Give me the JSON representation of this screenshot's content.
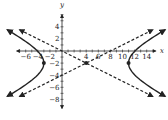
{
  "chart_data": {
    "type": "line",
    "title": "",
    "xlabel": "x",
    "ylabel": "y",
    "xlim": [
      -7.5,
      15.5
    ],
    "ylim": [
      -9.5,
      6
    ],
    "x_ticks": [
      -6,
      -4,
      -2,
      2,
      4,
      6,
      8,
      10,
      12,
      14
    ],
    "x_tick_labels": [
      "−6",
      "−4",
      "−2",
      "",
      "4",
      "6",
      "8",
      "10",
      "12",
      "14"
    ],
    "y_ticks": [
      4,
      2,
      -2,
      -4,
      -6,
      -8
    ],
    "y_tick_labels": [
      "4",
      "2",
      "−2",
      "−4",
      "−6",
      "−8"
    ],
    "grid": false,
    "legend": null,
    "series": [
      {
        "name": "hyperbola",
        "kind": "hyperbola",
        "equation": "(x-4)^2/49 - (y+2)^2/12.25 = 1",
        "center": [
          4,
          -2
        ],
        "a": 7,
        "b": 3.5,
        "style": "solid",
        "branch_y_range": [
          -7.5,
          3.5
        ]
      },
      {
        "name": "asymptote-1",
        "kind": "line",
        "equation": "y = -x/2",
        "style": "dashed",
        "x_range": [
          -7,
          15
        ],
        "points": [
          [
            -7,
            3.5
          ],
          [
            15,
            -7.5
          ]
        ]
      },
      {
        "name": "asymptote-2",
        "kind": "line",
        "equation": "y = x/2 - 4",
        "style": "dashed",
        "x_range": [
          -7,
          15
        ],
        "points": [
          [
            -7,
            -7.5
          ],
          [
            15,
            3.5
          ]
        ]
      }
    ],
    "points": [
      {
        "label": "center",
        "x": 4,
        "y": -2
      },
      {
        "label": "vertex-left",
        "x": -3,
        "y": -2
      },
      {
        "label": "vertex-right",
        "x": 11,
        "y": -2
      }
    ]
  },
  "axes": {
    "x_label": "x",
    "y_label": "y"
  }
}
